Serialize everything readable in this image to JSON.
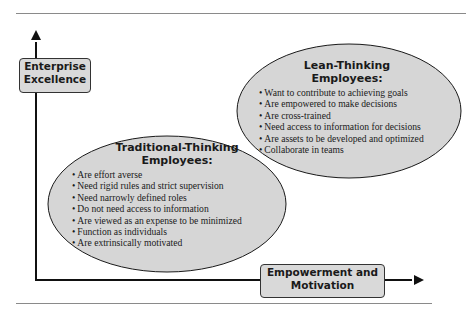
{
  "diagram": {
    "y_axis_label": "Enterprise Excellence",
    "y_axis_label_lines": [
      "Enterprise",
      "Excellence"
    ],
    "x_axis_label_lines": [
      "Empowerment and",
      "Motivation"
    ],
    "x_axis_label": "Empowerment and Motivation",
    "lean": {
      "title_lines": [
        "Lean-Thinking",
        "Employees:"
      ],
      "items": [
        "Want to contribute to achieving goals",
        "Are empowered to make decisions",
        "Are cross-trained",
        "Need access to information for decisions",
        "Are assets to be developed and optimized",
        "Collaborate in teams"
      ]
    },
    "traditional": {
      "title_lines": [
        "Traditional-Thinking",
        "Employees:"
      ],
      "items": [
        "Are effort averse",
        "Need rigid rules and strict supervision",
        "Need narrowly defined roles",
        "Do not need access to information",
        "Are viewed as an expense to be minimized",
        "Function as individuals",
        "Are extrinsically motivated"
      ]
    },
    "colors": {
      "ellipse_fill": "#d6d6d6",
      "box_fill": "#d9d9d9",
      "stroke": "#1a1a1a"
    }
  }
}
